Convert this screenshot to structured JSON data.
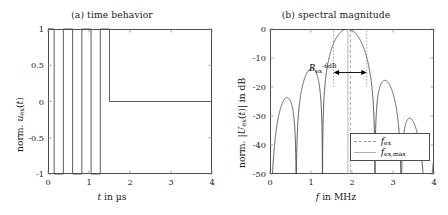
{
  "figure": {
    "panels": [
      {
        "id": "a",
        "title": "(a) time behavior",
        "xlabel_html": "<i class=\"mi\">t</i> in µs",
        "ylabel_html": "norm. <i class=\"mi\">u</i><span class=\"sub\">ex</span>(<i class=\"mi\">t</i>)",
        "xticks": [
          "0",
          "1",
          "2",
          "3",
          "4"
        ],
        "yticks": [
          "1",
          "0.5",
          "0",
          "-0.5",
          "-1"
        ]
      },
      {
        "id": "b",
        "title": "(b) spectral magnitude",
        "xlabel_html": "<i class=\"mi\">f</i> in MHz",
        "ylabel_html": "norm. |<u class=\"mi\" style=\"text-decoration:none;font-style:italic\">U</u><span class=\"sub\">ex</span>(<i class=\"mi\">t</i>)| in dB",
        "xticks": [
          "0",
          "1",
          "2",
          "3",
          "4"
        ],
        "yticks": [
          "0",
          "-10",
          "-20",
          "-30",
          "-40",
          "-50"
        ],
        "annotation_html": "<i class=\"mi\">B</i><span class=\"sub\">ex</span><span class=\"sup\">-6dB</span>",
        "annotation_text": "B_ex^-6dB",
        "legend": [
          {
            "label_html": "<i class=\"mi\">f</i><span class=\"sub\">ex</span>",
            "label_text": "f_ex",
            "style": "dash"
          },
          {
            "label_html": "<i class=\"mi\">f</i><span class=\"sub\">ex,max</span>",
            "label_text": "f_ex,max",
            "style": "solid"
          }
        ]
      }
    ]
  },
  "chart_data": [
    {
      "type": "line",
      "title": "(a) time behavior",
      "xlabel": "t in µs",
      "ylabel": "norm. u_ex(t)",
      "xlim": [
        0,
        4
      ],
      "ylim": [
        -1,
        1
      ],
      "xticks": [
        0,
        1,
        2,
        3,
        4
      ],
      "yticks": [
        -1,
        -0.5,
        0,
        0.5,
        1
      ],
      "grid": false,
      "legend": "none",
      "series": [
        {
          "name": "u_ex(t)",
          "color": "#4d4d4d",
          "description": "bipolar square-wave burst of 3 cycles, period 0.45 µs (f_ex ≈ 2.22 MHz), starting at t = 0.15 µs, ending at t = 1.50 µs, zero afterwards",
          "x": [
            0.0,
            0.15,
            0.15,
            0.375,
            0.375,
            0.6,
            0.6,
            0.825,
            0.825,
            1.05,
            1.05,
            1.275,
            1.275,
            1.5,
            1.5,
            4.0
          ],
          "y": [
            1,
            1,
            -1,
            -1,
            1,
            1,
            -1,
            -1,
            1,
            1,
            -1,
            -1,
            1,
            1,
            0,
            0
          ]
        }
      ]
    },
    {
      "type": "line",
      "title": "(b) spectral magnitude",
      "xlabel": "f in MHz",
      "ylabel": "norm. |U_ex(t)| in dB",
      "xlim": [
        0,
        4
      ],
      "ylim": [
        -50,
        0
      ],
      "xticks": [
        0,
        1,
        2,
        3,
        4
      ],
      "yticks": [
        -50,
        -40,
        -30,
        -20,
        -10,
        0
      ],
      "grid": false,
      "legend_position": "lower right",
      "annotations": [
        {
          "text": "B_ex^-6dB",
          "type": "double-arrow",
          "x_start": 1.55,
          "x_end": 2.36,
          "y": -15
        }
      ],
      "vlines": [
        {
          "name": "f_ex",
          "x": 1.96,
          "style": "dashed",
          "color": "#9a9a9a"
        },
        {
          "name": "f_ex,max",
          "x": 1.9,
          "style": "solid",
          "color": "#b0b0b0"
        }
      ],
      "series": [
        {
          "name": "|U_ex(f)| normalized",
          "color": "#4d4d4d",
          "description": "sinc-like spectrum of the 3-cycle square burst; main lobe peak 0 dB at f = 1.92 MHz; nulls at 0.00, 0.67, 1.33, 2.58, 3.28, 3.95 MHz; side-lobe peaks -11.8, -10.0, -18.4, -30.8 dB",
          "peaks": [
            {
              "f": 0.33,
              "db": -11.8
            },
            {
              "f": 0.99,
              "db": -10.0
            },
            {
              "f": 1.92,
              "db": 0.0
            },
            {
              "f": 2.92,
              "db": -18.4
            },
            {
              "f": 3.6,
              "db": -30.8
            }
          ],
          "nulls": [
            0.0,
            0.67,
            1.33,
            2.58,
            3.28,
            3.95
          ],
          "endpoint_db": {
            "f0": -30.5,
            "f4": -47.0
          }
        }
      ]
    }
  ]
}
